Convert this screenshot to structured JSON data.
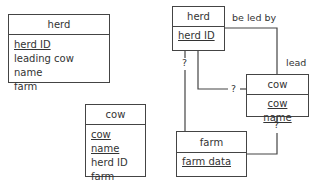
{
  "left_tables": [
    {
      "title": "herd",
      "fields": [
        {
          "name": "herd ID",
          "key": true
        },
        {
          "name": "leading cow name",
          "key": false
        },
        {
          "name": "farm",
          "key": false
        }
      ]
    },
    {
      "title": "cow",
      "fields": [
        {
          "name": "cow name",
          "key": true
        },
        {
          "name": "herd ID",
          "key": false
        },
        {
          "name": "farm",
          "key": false
        }
      ]
    }
  ],
  "er_diagram": {
    "entities": {
      "herd": {
        "title": "herd",
        "key": "herd ID"
      },
      "cow": {
        "title": "cow",
        "key": "cow name"
      },
      "farm": {
        "title": "farm",
        "key": "farm data"
      }
    },
    "relationship_labels": {
      "be_led_by": "be led by",
      "lead": "lead",
      "herd_farm_cardinality": "?",
      "herd_cow_cardinality": "?",
      "cow_farm_cardinality": "?"
    }
  }
}
